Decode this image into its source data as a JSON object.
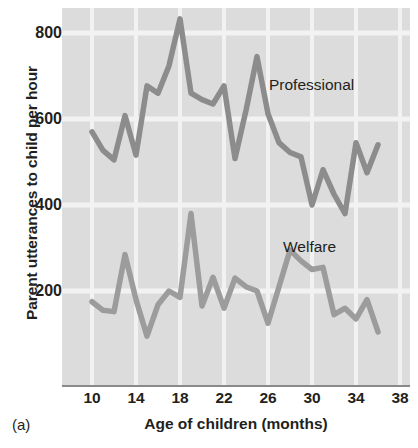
{
  "figure": {
    "panel_tag": "(a)",
    "xlabel": "Age of children (months)",
    "ylabel": "Parent utterances to child per hour"
  },
  "axes": {
    "y_ticks": [
      800,
      600,
      400,
      200
    ],
    "x_ticks": [
      10,
      14,
      18,
      22,
      26,
      30,
      34,
      38
    ]
  },
  "labels": {
    "professional": "Professional",
    "welfare": "Welfare"
  },
  "colors": {
    "plot_background": "#dcdcdc",
    "gridline": "#f2f2f2",
    "line": "#8c8c8c",
    "axis": "#8a8a8a",
    "text": "#231f20"
  },
  "chart_data": {
    "type": "line",
    "title": "",
    "xlabel": "Age of children (months)",
    "ylabel": "Parent utterances to child per hour",
    "xlim": [
      9,
      38
    ],
    "ylim": [
      0,
      850
    ],
    "grid": true,
    "legend_position": "inline-annotation",
    "x": [
      10,
      11,
      12,
      13,
      14,
      15,
      16,
      17,
      18,
      19,
      20,
      21,
      22,
      23,
      24,
      25,
      26,
      27,
      28,
      29,
      30,
      31,
      32,
      33,
      34,
      35,
      36
    ],
    "series": [
      {
        "name": "Professional",
        "color": "#8c8c8c",
        "values": [
          570,
          527,
          505,
          608,
          516,
          677,
          660,
          724,
          833,
          660,
          645,
          635,
          677,
          508,
          620,
          745,
          612,
          545,
          522,
          512,
          400,
          482,
          425,
          380,
          545,
          475,
          540
        ]
      },
      {
        "name": "Welfare",
        "color": "#9c9c9c",
        "values": [
          175,
          155,
          152,
          285,
          180,
          95,
          168,
          200,
          185,
          380,
          165,
          232,
          160,
          230,
          210,
          200,
          125,
          210,
          295,
          270,
          250,
          255,
          145,
          160,
          135,
          180,
          105
        ]
      }
    ]
  }
}
